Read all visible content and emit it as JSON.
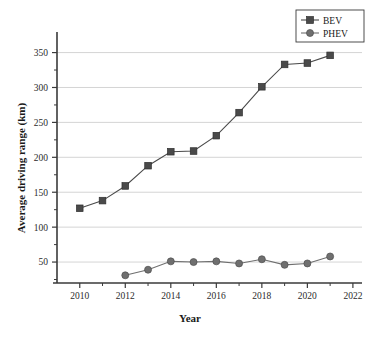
{
  "chart_data": {
    "type": "line",
    "title": "",
    "xlabel": "Year",
    "ylabel": "Average driving range (km)",
    "xlim": [
      2009,
      2022.4
    ],
    "ylim": [
      20,
      368
    ],
    "xticks": [
      2010,
      2012,
      2014,
      2016,
      2018,
      2020,
      2022
    ],
    "xtick_labels": [
      "2010",
      "2012",
      "2014",
      "2016",
      "2018",
      "2020",
      "2022"
    ],
    "yticks": [
      50,
      100,
      150,
      200,
      250,
      300,
      350
    ],
    "ytick_labels": [
      "50",
      "100",
      "150",
      "200",
      "250",
      "300",
      "350"
    ],
    "grid": "horizontal",
    "legend_position": "top-right",
    "x": [
      2010,
      2011,
      2012,
      2013,
      2014,
      2015,
      2016,
      2017,
      2018,
      2019,
      2020,
      2021
    ],
    "series": [
      {
        "name": "BEV",
        "marker": "square",
        "color": "#4a4a4a",
        "x": [
          2010,
          2011,
          2012,
          2013,
          2014,
          2015,
          2016,
          2017,
          2018,
          2019,
          2020,
          2021
        ],
        "values": [
          127,
          138,
          159,
          188,
          208,
          209,
          231,
          264,
          301,
          333,
          335,
          346
        ]
      },
      {
        "name": "PHEV",
        "marker": "circle",
        "color": "#6f6f6f",
        "x": [
          2012,
          2013,
          2014,
          2015,
          2016,
          2017,
          2018,
          2019,
          2020,
          2021
        ],
        "values": [
          31,
          39,
          51,
          50,
          51,
          48,
          54,
          46,
          48,
          58
        ]
      }
    ]
  },
  "legend": {
    "items": [
      {
        "label": "BEV"
      },
      {
        "label": "PHEV"
      }
    ]
  },
  "axes": {
    "x_title": "Year",
    "y_title": "Average driving range (km)"
  },
  "colors": {
    "bev": "#4a4a4a",
    "phev": "#6f6f6f",
    "grid": "#c9c9c9",
    "axis": "#3a3a3a",
    "text": "#1a1a1a"
  }
}
